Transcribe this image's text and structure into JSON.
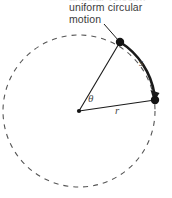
{
  "figure": {
    "width": 172,
    "height": 198,
    "background_color": "#ffffff",
    "stroke_color": "#1a1a1a",
    "dashed_circle_color": "#555555",
    "text_color": "#3a3a3a"
  },
  "caption": {
    "line1": "uniform circular",
    "line2": "motion",
    "clipped_line_above": "angular velocity,"
  },
  "labels": {
    "theta": "θ",
    "radius": "r",
    "arc_length": "s"
  },
  "geometry": {
    "center": {
      "x": 79,
      "y": 111
    },
    "radius": 76,
    "point_a": {
      "x": 120,
      "y": 42
    },
    "point_b": {
      "x": 155,
      "y": 100
    },
    "dash_pattern": "5 5",
    "arc_stroke_width": 2.6,
    "radius_stroke_width": 1.1
  },
  "icons": {
    "arrowhead": "arrowhead-icon",
    "leader_line": "leader-line-icon",
    "center_dot": "center-point-icon",
    "particle_start": "particle-dot-icon",
    "particle_end": "particle-dot-icon"
  }
}
